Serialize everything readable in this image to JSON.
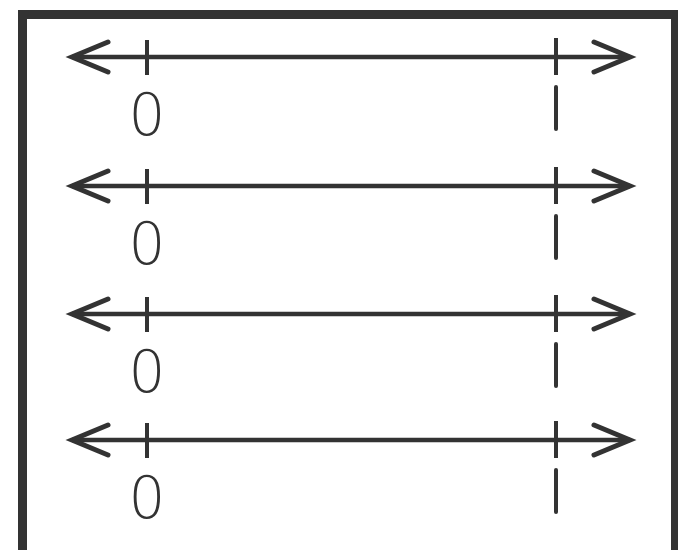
{
  "worksheet": {
    "title": "",
    "number_lines": [
      {
        "start_label": "0",
        "end_label": "1",
        "y": 57
      },
      {
        "start_label": "0",
        "end_label": "1",
        "y": 186
      },
      {
        "start_label": "0",
        "end_label": "1",
        "y": 314
      },
      {
        "start_label": "0",
        "end_label": "1",
        "y": 440
      }
    ],
    "colors": {
      "ink": "#333333",
      "background": "#ffffff"
    }
  }
}
